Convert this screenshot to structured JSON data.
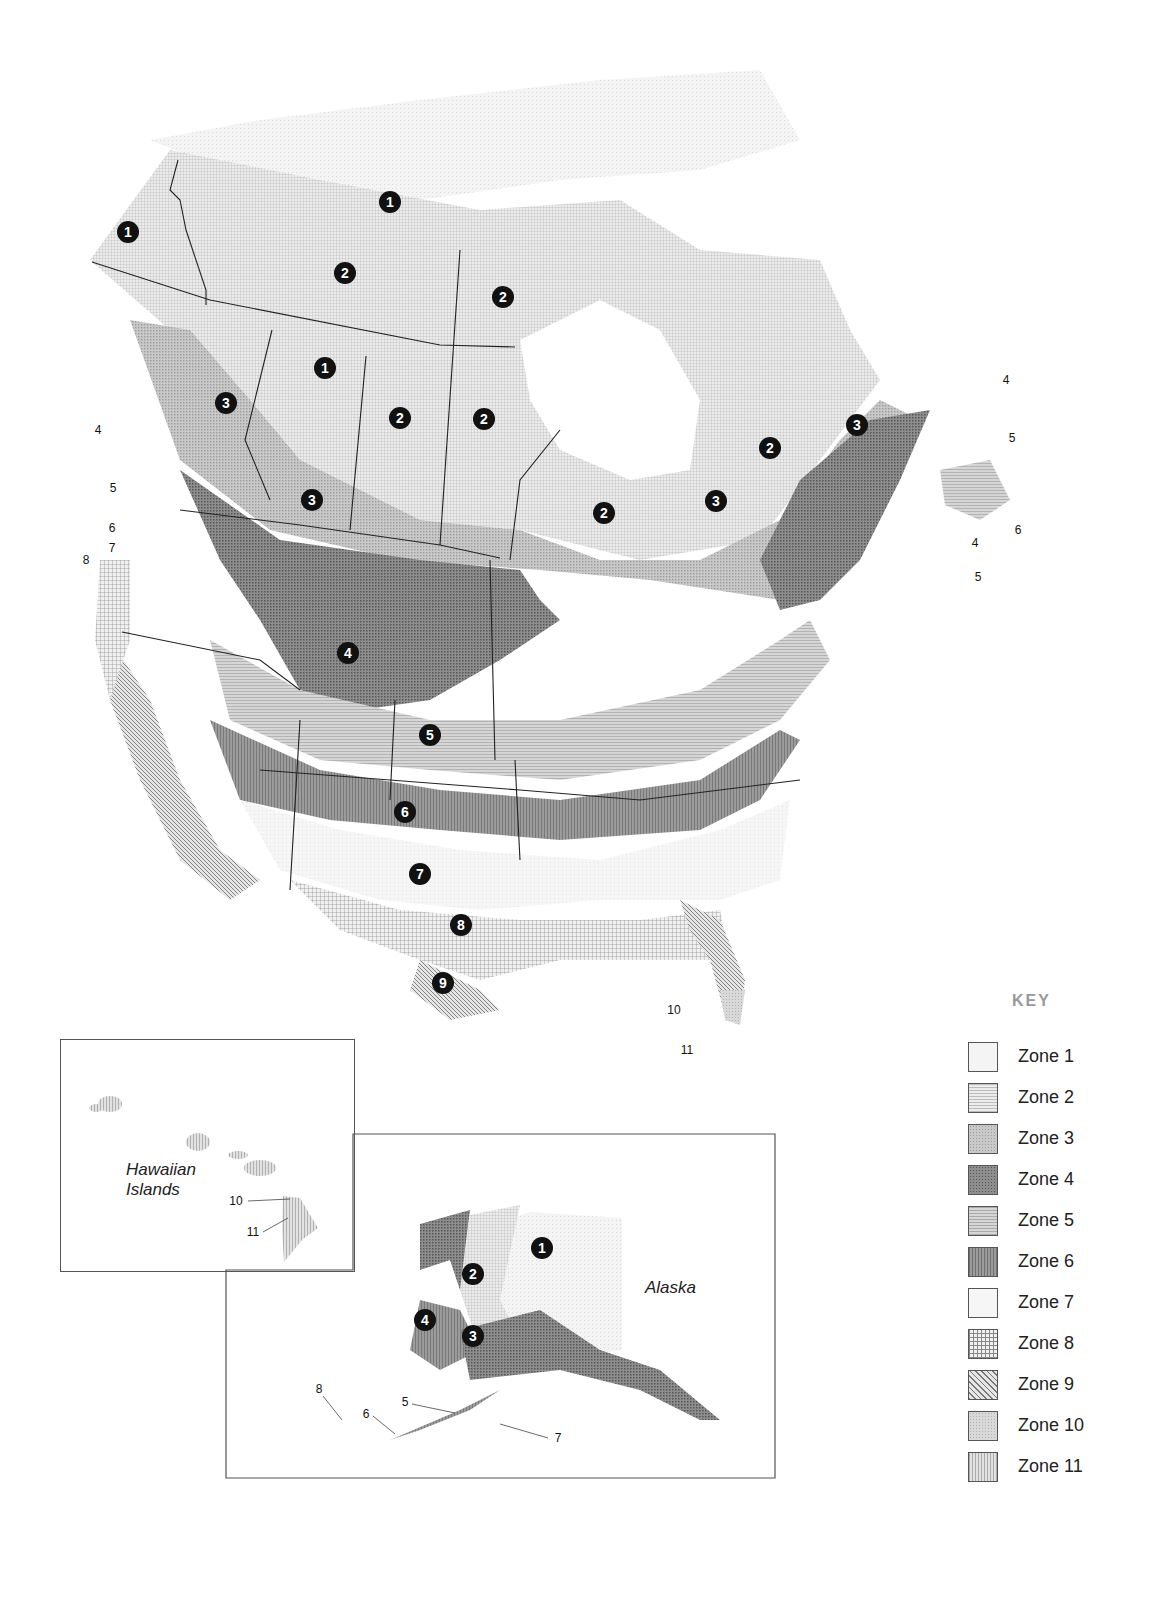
{
  "key": {
    "title": "KEY",
    "items": [
      {
        "label": "Zone 1",
        "pattern": "sw1"
      },
      {
        "label": "Zone 2",
        "pattern": "sw2"
      },
      {
        "label": "Zone 3",
        "pattern": "sw3"
      },
      {
        "label": "Zone 4",
        "pattern": "sw4"
      },
      {
        "label": "Zone 5",
        "pattern": "sw5"
      },
      {
        "label": "Zone 6",
        "pattern": "sw6"
      },
      {
        "label": "Zone 7",
        "pattern": "sw7"
      },
      {
        "label": "Zone 8",
        "pattern": "sw8"
      },
      {
        "label": "Zone 9",
        "pattern": "sw9"
      },
      {
        "label": "Zone 10",
        "pattern": "sw10"
      },
      {
        "label": "Zone 11",
        "pattern": "sw11"
      }
    ]
  },
  "main_map": {
    "zone_markers": [
      {
        "n": "1",
        "x": 390,
        "y": 202
      },
      {
        "n": "1",
        "x": 128,
        "y": 232
      },
      {
        "n": "1",
        "x": 325,
        "y": 368
      },
      {
        "n": "2",
        "x": 345,
        "y": 273
      },
      {
        "n": "2",
        "x": 503,
        "y": 297
      },
      {
        "n": "2",
        "x": 400,
        "y": 418
      },
      {
        "n": "2",
        "x": 484,
        "y": 419
      },
      {
        "n": "2",
        "x": 604,
        "y": 513
      },
      {
        "n": "2",
        "x": 770,
        "y": 448
      },
      {
        "n": "3",
        "x": 226,
        "y": 403
      },
      {
        "n": "3",
        "x": 312,
        "y": 500
      },
      {
        "n": "3",
        "x": 716,
        "y": 501
      },
      {
        "n": "3",
        "x": 857,
        "y": 425
      },
      {
        "n": "4",
        "x": 348,
        "y": 653
      },
      {
        "n": "5",
        "x": 430,
        "y": 735
      },
      {
        "n": "6",
        "x": 405,
        "y": 812
      },
      {
        "n": "7",
        "x": 420,
        "y": 874
      },
      {
        "n": "8",
        "x": 461,
        "y": 925
      },
      {
        "n": "9",
        "x": 443,
        "y": 983
      }
    ],
    "callouts": [
      {
        "label": "4",
        "x": 98,
        "y": 430
      },
      {
        "label": "5",
        "x": 113,
        "y": 488
      },
      {
        "label": "6",
        "x": 112,
        "y": 528
      },
      {
        "label": "7",
        "x": 112,
        "y": 548
      },
      {
        "label": "8",
        "x": 86,
        "y": 560
      },
      {
        "label": "4",
        "x": 1006,
        "y": 380
      },
      {
        "label": "5",
        "x": 1012,
        "y": 438
      },
      {
        "label": "6",
        "x": 1018,
        "y": 530
      },
      {
        "label": "4",
        "x": 975,
        "y": 543
      },
      {
        "label": "5",
        "x": 978,
        "y": 577
      },
      {
        "label": "10",
        "x": 674,
        "y": 1010
      },
      {
        "label": "11",
        "x": 687,
        "y": 1050
      }
    ]
  },
  "hawaii_inset": {
    "title_line1": "Hawaiian",
    "title_line2": "Islands",
    "callouts": [
      {
        "label": "10",
        "x": 236,
        "y": 1201
      },
      {
        "label": "11",
        "x": 253,
        "y": 1232
      }
    ]
  },
  "alaska_inset": {
    "title": "Alaska",
    "zone_markers": [
      {
        "n": "1",
        "x": 542,
        "y": 1248
      },
      {
        "n": "2",
        "x": 473,
        "y": 1274
      },
      {
        "n": "4",
        "x": 425,
        "y": 1320
      },
      {
        "n": "3",
        "x": 473,
        "y": 1336
      }
    ],
    "callouts": [
      {
        "label": "5",
        "x": 405,
        "y": 1402
      },
      {
        "label": "6",
        "x": 366,
        "y": 1414
      },
      {
        "label": "7",
        "x": 558,
        "y": 1438
      },
      {
        "label": "8",
        "x": 319,
        "y": 1389
      }
    ]
  }
}
